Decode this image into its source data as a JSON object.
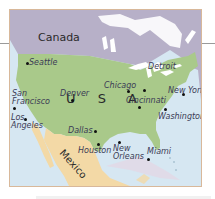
{
  "map": {
    "colors": {
      "water": "#d6e7f2",
      "canada": "#b7b0c8",
      "usa": "#a9c98a",
      "mexico": "#f3d9a6",
      "border": "#d8b89a",
      "lakes": "#ffffff"
    },
    "countries": {
      "canada": "Canada",
      "usa": "U S A",
      "mexico": "Mexico"
    },
    "cities": [
      {
        "name": "Seattle"
      },
      {
        "name": "San Francisco",
        "line1": "San",
        "line2": "Francisco"
      },
      {
        "name": "Los Angeles",
        "line1": "Los",
        "line2": "Angeles"
      },
      {
        "name": "Denver"
      },
      {
        "name": "Chicago"
      },
      {
        "name": "Detroit"
      },
      {
        "name": "Cincinnati"
      },
      {
        "name": "New York"
      },
      {
        "name": "Washington"
      },
      {
        "name": "Dallas"
      },
      {
        "name": "Houston"
      },
      {
        "name": "New Orleans",
        "line1": "New",
        "line2": "Orleans"
      },
      {
        "name": "Miami"
      }
    ]
  }
}
